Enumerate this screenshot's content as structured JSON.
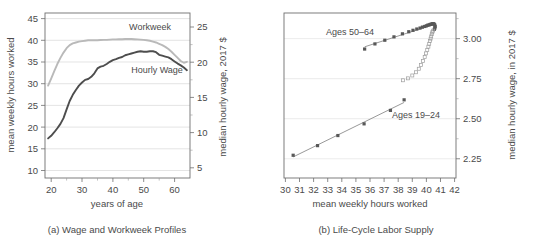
{
  "figure": {
    "panels": [
      {
        "id": "a",
        "caption": "(a) Wage and Workweek Profiles"
      },
      {
        "id": "b",
        "caption": "(b) Life-Cycle Labor Supply"
      }
    ]
  },
  "chart_data": [
    {
      "type": "line",
      "panel": "a",
      "title": "(a) Wage and Workweek Profiles",
      "xlabel": "years of age",
      "ylabel": "mean weekly hours worked",
      "y2label": "median hourly wage, 2017 $",
      "xlim": [
        18,
        65
      ],
      "ylim": [
        9,
        46.5
      ],
      "y2lim": [
        4.2,
        26.4
      ],
      "xticks": [
        20,
        30,
        40,
        50,
        60
      ],
      "yticks": [
        10,
        15,
        20,
        25,
        30,
        35,
        40,
        45
      ],
      "y2ticks": [
        5,
        10,
        15,
        20,
        25
      ],
      "grid": true,
      "legend": "inline-annotations",
      "series": [
        {
          "name": "Workweek",
          "axis": "left",
          "color": "#b9b9b9",
          "annotation": "Workweek",
          "x": [
            19,
            20,
            21,
            22,
            23,
            24,
            25,
            26,
            27,
            28,
            29,
            30,
            31,
            32,
            33,
            34,
            35,
            36,
            37,
            38,
            39,
            40,
            41,
            42,
            43,
            44,
            45,
            46,
            47,
            48,
            49,
            50,
            51,
            52,
            53,
            54,
            55,
            56,
            57,
            58,
            59,
            60,
            61,
            62,
            63,
            64
          ],
          "values": [
            30.0,
            31.6,
            33.3,
            34.9,
            36.3,
            37.5,
            38.5,
            39.2,
            39.6,
            39.8,
            40.0,
            40.1,
            40.2,
            40.3,
            40.3,
            40.3,
            40.3,
            40.35,
            40.4,
            40.4,
            40.45,
            40.5,
            40.5,
            40.55,
            40.55,
            40.6,
            40.6,
            40.6,
            40.55,
            40.5,
            40.45,
            40.4,
            40.3,
            40.2,
            40.0,
            39.8,
            39.5,
            39.2,
            38.8,
            38.3,
            37.7,
            37.0,
            36.3,
            35.6,
            35.2,
            35.4
          ]
        },
        {
          "name": "Hourly Wage",
          "axis": "right",
          "color": "#4d4d4d",
          "annotation": "Hourly Wage",
          "x": [
            19,
            20,
            21,
            22,
            23,
            24,
            25,
            26,
            27,
            28,
            29,
            30,
            31,
            32,
            33,
            34,
            35,
            36,
            37,
            38,
            39,
            40,
            41,
            42,
            43,
            44,
            45,
            46,
            47,
            48,
            49,
            50,
            51,
            52,
            53,
            54,
            55,
            56,
            57,
            58,
            59,
            60,
            61,
            62,
            63,
            64
          ],
          "values_left_scale": [
            18.0,
            18.6,
            19.4,
            20.3,
            21.3,
            22.6,
            24.6,
            26.5,
            27.9,
            29.0,
            30.0,
            30.7,
            31.3,
            31.5,
            32.0,
            32.8,
            33.9,
            34.3,
            34.5,
            34.9,
            35.4,
            35.8,
            36.0,
            36.3,
            36.5,
            36.9,
            37.1,
            37.3,
            37.5,
            37.7,
            37.8,
            37.7,
            37.7,
            37.8,
            37.8,
            37.6,
            37.0,
            36.8,
            36.6,
            36.4,
            36.0,
            35.5,
            35.0,
            34.6,
            34.1,
            33.5
          ],
          "values_wage": [
            9.6,
            9.9,
            10.3,
            10.8,
            11.3,
            12.0,
            13.0,
            14.0,
            14.7,
            15.3,
            15.8,
            16.2,
            16.5,
            16.6,
            16.9,
            17.3,
            17.9,
            18.1,
            18.2,
            18.4,
            18.7,
            18.9,
            19.0,
            19.1,
            19.3,
            19.5,
            19.6,
            19.7,
            19.8,
            19.9,
            20.0,
            19.9,
            19.9,
            20.0,
            20.0,
            19.9,
            19.6,
            19.4,
            19.3,
            19.2,
            19.0,
            18.8,
            18.5,
            18.3,
            18.0,
            17.7
          ]
        }
      ]
    },
    {
      "type": "scatter",
      "panel": "b",
      "title": "(b) Life-Cycle Labor Supply",
      "xlabel": "mean weekly hours worked",
      "ylabel": "median hourly wage, in 2017 $",
      "xlim": [
        29.9,
        42.1
      ],
      "ylim": [
        2.13,
        3.16
      ],
      "xticks": [
        30,
        31,
        32,
        33,
        34,
        35,
        36,
        37,
        38,
        39,
        40,
        41,
        42
      ],
      "yticks": [
        2.25,
        2.5,
        2.75,
        3.0
      ],
      "ytick_labels": [
        "2.25",
        "2.50",
        "2.75",
        "3.00"
      ],
      "grid": true,
      "series": [
        {
          "name": "Ages 50-64",
          "annotation": "Ages 50–64",
          "marker": "filled-square",
          "fit_line": true,
          "points": [
            [
              35.62,
              2.935
            ],
            [
              36.35,
              2.967
            ],
            [
              37.05,
              2.99
            ],
            [
              37.7,
              3.011
            ],
            [
              38.3,
              3.03
            ],
            [
              38.75,
              3.043
            ],
            [
              39.05,
              3.052
            ],
            [
              39.32,
              3.06
            ],
            [
              39.55,
              3.066
            ],
            [
              39.72,
              3.072
            ],
            [
              39.88,
              3.076
            ],
            [
              40.0,
              3.08
            ],
            [
              40.1,
              3.084
            ],
            [
              40.2,
              3.086
            ],
            [
              40.28,
              3.089
            ],
            [
              40.36,
              3.091
            ],
            [
              40.44,
              3.093
            ],
            [
              40.5,
              3.093
            ],
            [
              40.56,
              3.09
            ],
            [
              40.6,
              3.084
            ],
            [
              40.62,
              3.075
            ],
            [
              40.6,
              3.066
            ],
            [
              40.56,
              3.058
            ]
          ]
        },
        {
          "name": "Ages 25-49 transition",
          "annotation": "",
          "marker": "open-square",
          "fit_line": false,
          "points": [
            [
              40.48,
              3.05
            ],
            [
              40.42,
              3.04
            ],
            [
              40.38,
              3.028
            ],
            [
              40.34,
              3.014
            ],
            [
              40.3,
              3.0
            ],
            [
              40.26,
              2.985
            ],
            [
              40.2,
              2.968
            ],
            [
              40.14,
              2.95
            ],
            [
              40.06,
              2.93
            ],
            [
              39.98,
              2.908
            ],
            [
              39.88,
              2.885
            ],
            [
              39.76,
              2.86
            ],
            [
              39.62,
              2.836
            ],
            [
              39.46,
              2.812
            ],
            [
              39.26,
              2.79
            ],
            [
              39.0,
              2.77
            ],
            [
              38.7,
              2.752
            ],
            [
              38.35,
              2.74
            ]
          ]
        },
        {
          "name": "Ages 19-24",
          "annotation": "Ages 19–24",
          "marker": "filled-square",
          "fit_line": true,
          "points": [
            [
              30.55,
              2.272
            ],
            [
              32.28,
              2.332
            ],
            [
              33.72,
              2.395
            ],
            [
              35.58,
              2.468
            ],
            [
              37.45,
              2.552
            ],
            [
              38.42,
              2.618
            ]
          ]
        }
      ]
    }
  ]
}
